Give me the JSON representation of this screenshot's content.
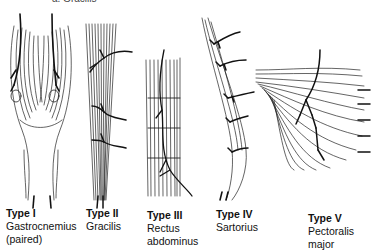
{
  "figure": {
    "top_fragment": "a. Gracilis",
    "panels": [
      {
        "type": "Type I",
        "muscle": "Gastrocnemius",
        "note": "(paired)"
      },
      {
        "type": "Type II",
        "muscle": "Gracilis",
        "note": ""
      },
      {
        "type": "Type III",
        "muscle": "Rectus",
        "note": "abdominus"
      },
      {
        "type": "Type IV",
        "muscle": "Sartorius",
        "note": ""
      },
      {
        "type": "Type V",
        "muscle": "Pectoralis",
        "note": "major"
      }
    ],
    "colors": {
      "ink": "#111111",
      "background": "#ffffff"
    }
  }
}
